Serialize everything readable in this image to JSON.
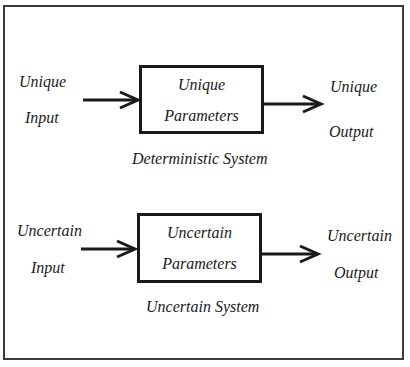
{
  "deterministic": {
    "input_line1": "Unique",
    "input_line2": "Input",
    "box_line1": "Unique",
    "box_line2": "Parameters",
    "output_line1": "Unique",
    "output_line2": "Output",
    "caption": "Deterministic System"
  },
  "uncertain": {
    "input_line1": "Uncertain",
    "input_line2": "Input",
    "box_line1": "Uncertain",
    "box_line2": "Parameters",
    "output_line1": "Uncertain",
    "output_line2": "Output",
    "caption": "Uncertain System"
  },
  "colors": {
    "stroke": "#1a1a1a",
    "frame": "#3a3a3a",
    "background": "#ffffff"
  }
}
